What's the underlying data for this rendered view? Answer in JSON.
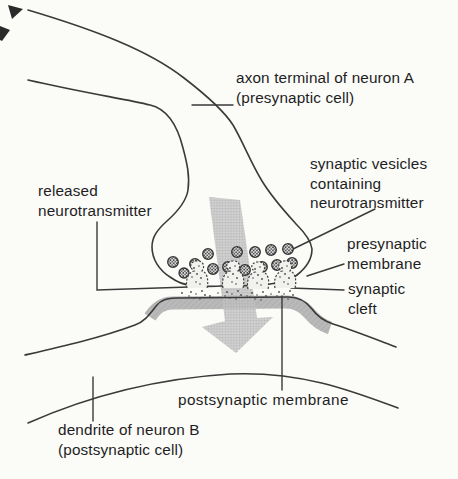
{
  "figure": {
    "background": "#fbfbf8",
    "ink_color": "#3a3a3a",
    "arrow_color": "#c4c4c4",
    "membrane_band_color": "#b9b9b9",
    "labels": {
      "axon_terminal": [
        "axon terminal of neuron A",
        "(presynaptic cell)"
      ],
      "synaptic_vesicles": [
        "synaptic vesicles",
        "containing",
        "neurotransmitter"
      ],
      "presynaptic_membrane": [
        "presynaptic",
        "membrane"
      ],
      "synaptic_cleft": [
        "synaptic",
        "cleft"
      ],
      "released_neurotransmitter": [
        "released",
        "neurotransmitter"
      ],
      "postsynaptic_membrane": [
        "postsynaptic membrane"
      ],
      "dendrite": [
        "dendrite of neuron B",
        "(postsynaptic cell)"
      ]
    }
  }
}
